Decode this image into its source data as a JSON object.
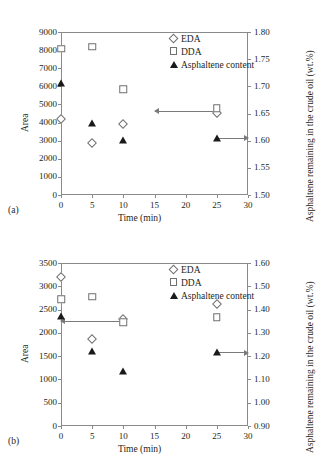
{
  "figure": {
    "panels": [
      {
        "tag": "(a)",
        "legend": [
          {
            "marker": "diamond-open",
            "label": "EDA"
          },
          {
            "marker": "square-open",
            "label": "DDA"
          },
          {
            "marker": "triangle-filled",
            "label": "Asphaltene content"
          }
        ]
      },
      {
        "tag": "(b)",
        "legend": [
          {
            "marker": "diamond-open",
            "label": "EDA"
          },
          {
            "marker": "square-open",
            "label": "DDA"
          },
          {
            "marker": "triangle-filled",
            "label": "Asphaltene content"
          }
        ]
      }
    ]
  },
  "chart_data": [
    {
      "type": "scatter",
      "title": "",
      "panel": "(a)",
      "xlabel": "Time (min)",
      "ylabel": "Area",
      "y2label": "Asphaltene remaining in the crude oil (wt.%)",
      "xlim": [
        0,
        30
      ],
      "xticks": [
        0,
        5,
        10,
        15,
        20,
        25,
        30
      ],
      "ylim": [
        0,
        9000
      ],
      "yticks": [
        0,
        1000,
        2000,
        3000,
        4000,
        5000,
        6000,
        7000,
        8000,
        9000
      ],
      "y2lim": [
        1.5,
        1.8
      ],
      "y2ticks": [
        1.5,
        1.55,
        1.6,
        1.65,
        1.7,
        1.75,
        1.8
      ],
      "grid": false,
      "legend_position": "top-right",
      "series": [
        {
          "name": "EDA",
          "axis": "left",
          "marker": "diamond-open",
          "x": [
            0,
            5,
            10,
            25
          ],
          "values": [
            4200,
            2870,
            3930,
            4520
          ]
        },
        {
          "name": "DDA",
          "axis": "left",
          "marker": "square-open",
          "x": [
            0,
            5,
            10,
            25
          ],
          "values": [
            8080,
            8180,
            5830,
            4790
          ]
        },
        {
          "name": "Asphaltene content",
          "axis": "right",
          "marker": "triangle-filled",
          "x": [
            0,
            5,
            10,
            25
          ],
          "values": [
            1.707,
            1.633,
            1.601,
            1.605
          ]
        }
      ],
      "annotations": [
        {
          "type": "arrow",
          "direction": "left",
          "from_x": 25,
          "to_x": 15,
          "y": 4650,
          "axis": "left"
        },
        {
          "type": "arrow",
          "direction": "right",
          "from_x": 25,
          "to_x": 30,
          "y": 1.605,
          "axis": "right"
        }
      ]
    },
    {
      "type": "scatter",
      "title": "",
      "panel": "(b)",
      "xlabel": "Time (min)",
      "ylabel": "Area",
      "y2label": "Asphaltene remaining in the crude oil (wt.%)",
      "xlim": [
        0,
        30
      ],
      "xticks": [
        0,
        5,
        10,
        15,
        20,
        25,
        30
      ],
      "ylim": [
        0,
        3500
      ],
      "yticks": [
        0,
        500,
        1000,
        1500,
        2000,
        2500,
        3000,
        3500
      ],
      "y2lim": [
        0.9,
        1.6
      ],
      "y2ticks": [
        0.9,
        1.0,
        1.1,
        1.2,
        1.3,
        1.4,
        1.5,
        1.6
      ],
      "grid": false,
      "legend_position": "top-right",
      "series": [
        {
          "name": "EDA",
          "axis": "left",
          "marker": "diamond-open",
          "x": [
            0,
            5,
            10,
            25
          ],
          "values": [
            3190,
            1870,
            2290,
            2630
          ]
        },
        {
          "name": "DDA",
          "axis": "left",
          "marker": "square-open",
          "x": [
            0,
            5,
            10,
            25
          ],
          "values": [
            2720,
            2770,
            2230,
            2340
          ]
        },
        {
          "name": "Asphaltene content",
          "axis": "right",
          "marker": "triangle-filled",
          "x": [
            0,
            5,
            10,
            25
          ],
          "values": [
            1.374,
            1.222,
            1.135,
            1.216
          ]
        }
      ],
      "annotations": [
        {
          "type": "arrow",
          "direction": "left",
          "from_x": 10,
          "to_x": 0,
          "y": 2260,
          "axis": "left"
        },
        {
          "type": "arrow",
          "direction": "right",
          "from_x": 25,
          "to_x": 30,
          "y": 1.216,
          "axis": "right"
        }
      ]
    }
  ]
}
